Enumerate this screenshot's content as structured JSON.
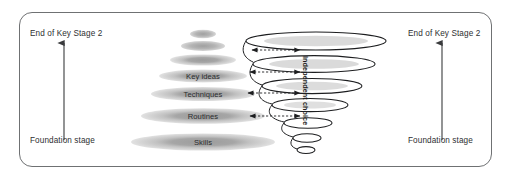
{
  "figure": {
    "kind": "double-cone-progression-diagram",
    "border_color": "#6f7173",
    "background": "#ffffff"
  },
  "left_axis": {
    "top_label": "End of Key Stage 2",
    "bottom_label": "Foundation stage",
    "arrow_direction": "up",
    "arrow_color": "#3a3b3d"
  },
  "right_axis": {
    "top_label": "End of Key Stage 2",
    "bottom_label": "Foundation stage",
    "arrow_direction": "up",
    "arrow_color": "#3a3b3d"
  },
  "cone": {
    "description": "stack of shaded ellipses widening downward",
    "fill_outer": "#cfcfcf",
    "fill_inner": "#9d9d9d",
    "levels": [
      {
        "label": "",
        "rx": 13,
        "ry": 4.2,
        "cy": 34
      },
      {
        "label": "",
        "rx": 22,
        "ry": 5.0,
        "cy": 46
      },
      {
        "label": "",
        "rx": 33,
        "ry": 5.6,
        "cy": 60
      },
      {
        "label": "Key ideas",
        "rx": 44,
        "ry": 6.4,
        "cy": 76
      },
      {
        "label": "Techniques",
        "rx": 52,
        "ry": 7.0,
        "cy": 94
      },
      {
        "label": "Routines",
        "rx": 62,
        "ry": 7.8,
        "cy": 116
      },
      {
        "label": "Skills",
        "rx": 72,
        "ry": 8.6,
        "cy": 142
      }
    ]
  },
  "spiral": {
    "description": "outlined ellipses narrowing downward, joined as a helix",
    "stroke": "#1d1e20",
    "vertical_text": "Independent choice",
    "rings": [
      {
        "rx": 70,
        "ry": 9.0,
        "cy": 41
      },
      {
        "rx": 61,
        "ry": 8.4,
        "cy": 64
      },
      {
        "rx": 50,
        "ry": 7.6,
        "cy": 86
      },
      {
        "rx": 38,
        "ry": 6.6,
        "cy": 105
      },
      {
        "rx": 24,
        "ry": 5.2,
        "cy": 123
      },
      {
        "rx": 14,
        "ry": 4.2,
        "cy": 138
      },
      {
        "rx": 9,
        "ry": 3.4,
        "cy": 150
      }
    ]
  },
  "connectors": {
    "style": "dashed bidirectional arrows",
    "color": "#2a2b2d",
    "count": 4,
    "rows": [
      {
        "y": 50
      },
      {
        "y": 72
      },
      {
        "y": 93
      },
      {
        "y": 116
      }
    ]
  }
}
